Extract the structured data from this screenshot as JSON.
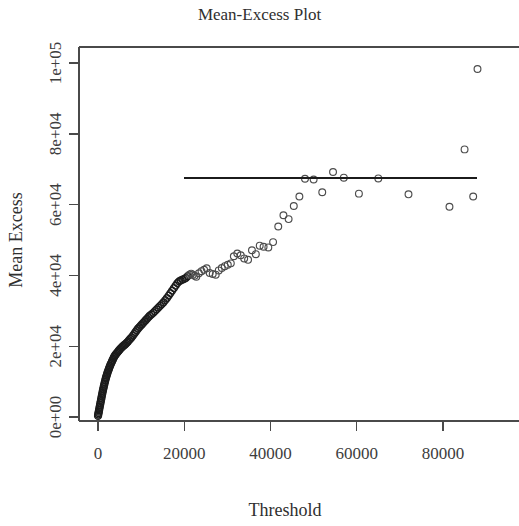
{
  "chart_data": {
    "type": "scatter",
    "title": "Mean-Excess Plot",
    "xlabel": "Threshold",
    "ylabel": "Mean Excess",
    "xlim": [
      -4000,
      98000
    ],
    "ylim": [
      -4000,
      104000
    ],
    "xticks": [
      0,
      20000,
      40000,
      60000,
      80000
    ],
    "xticklabels": [
      "0",
      "20000",
      "40000",
      "60000",
      "80000"
    ],
    "yticks": [
      0,
      20000,
      40000,
      60000,
      80000,
      100000
    ],
    "yticklabels": [
      "0e+00",
      "2e+04",
      "4e+04",
      "6e+04",
      "8e+04",
      "1e+05"
    ],
    "grid": false,
    "legend": null,
    "marker": "open-circle",
    "marker_color": "#4c4c4c",
    "reference_line": {
      "type": "horizontal",
      "y": 67500,
      "x_start": 19900,
      "x_end": 87900,
      "color": "#1b1b1b"
    },
    "points": [
      [
        10,
        300
      ],
      [
        60,
        700
      ],
      [
        120,
        1100
      ],
      [
        180,
        1500
      ],
      [
        250,
        1900
      ],
      [
        320,
        2400
      ],
      [
        400,
        2900
      ],
      [
        480,
        3400
      ],
      [
        560,
        3900
      ],
      [
        640,
        4400
      ],
      [
        720,
        4900
      ],
      [
        800,
        5400
      ],
      [
        880,
        5900
      ],
      [
        960,
        6400
      ],
      [
        1040,
        6900
      ],
      [
        1130,
        7400
      ],
      [
        1220,
        7900
      ],
      [
        1310,
        8400
      ],
      [
        1400,
        8900
      ],
      [
        1500,
        9400
      ],
      [
        1600,
        9900
      ],
      [
        1700,
        10400
      ],
      [
        1800,
        10900
      ],
      [
        1900,
        11300
      ],
      [
        2000,
        11700
      ],
      [
        2100,
        12100
      ],
      [
        2200,
        12500
      ],
      [
        2320,
        12900
      ],
      [
        2440,
        13300
      ],
      [
        2560,
        13700
      ],
      [
        2680,
        14100
      ],
      [
        2800,
        14500
      ],
      [
        2950,
        14900
      ],
      [
        3100,
        15300
      ],
      [
        3250,
        15700
      ],
      [
        3400,
        16100
      ],
      [
        3550,
        16500
      ],
      [
        3700,
        16900
      ],
      [
        3850,
        17200
      ],
      [
        4000,
        17500
      ],
      [
        4200,
        17800
      ],
      [
        4400,
        18100
      ],
      [
        4600,
        18400
      ],
      [
        4800,
        18700
      ],
      [
        5000,
        19000
      ],
      [
        5200,
        19300
      ],
      [
        5450,
        19600
      ],
      [
        5700,
        19900
      ],
      [
        5950,
        20200
      ],
      [
        6200,
        20400
      ],
      [
        6450,
        20700
      ],
      [
        6700,
        21000
      ],
      [
        6950,
        21300
      ],
      [
        7200,
        21700
      ],
      [
        7500,
        22100
      ],
      [
        7800,
        22500
      ],
      [
        8100,
        23000
      ],
      [
        8400,
        23500
      ],
      [
        8700,
        24000
      ],
      [
        9000,
        24500
      ],
      [
        9300,
        25000
      ],
      [
        9600,
        25400
      ],
      [
        9900,
        25800
      ],
      [
        10200,
        26200
      ],
      [
        10500,
        26600
      ],
      [
        10800,
        27000
      ],
      [
        11100,
        27400
      ],
      [
        11400,
        27800
      ],
      [
        11700,
        28200
      ],
      [
        12000,
        28600
      ],
      [
        12400,
        29000
      ],
      [
        12800,
        29400
      ],
      [
        13200,
        29900
      ],
      [
        13600,
        30400
      ],
      [
        14000,
        30900
      ],
      [
        14400,
        31400
      ],
      [
        14800,
        31900
      ],
      [
        15200,
        32400
      ],
      [
        15600,
        33000
      ],
      [
        16000,
        33600
      ],
      [
        16400,
        34300
      ],
      [
        16800,
        35000
      ],
      [
        17200,
        35700
      ],
      [
        17600,
        36400
      ],
      [
        18000,
        37100
      ],
      [
        18400,
        37800
      ],
      [
        18800,
        38300
      ],
      [
        19200,
        38600
      ],
      [
        19600,
        38800
      ],
      [
        20000,
        39000
      ],
      [
        20400,
        39300
      ],
      [
        20800,
        39800
      ],
      [
        21200,
        40200
      ],
      [
        21600,
        40500
      ],
      [
        22000,
        40200
      ],
      [
        22400,
        39900
      ],
      [
        22800,
        39600
      ],
      [
        23400,
        40600
      ],
      [
        24000,
        41200
      ],
      [
        24600,
        41600
      ],
      [
        25200,
        42000
      ],
      [
        25900,
        40700
      ],
      [
        26600,
        40400
      ],
      [
        27300,
        40200
      ],
      [
        28000,
        41400
      ],
      [
        28700,
        42100
      ],
      [
        29400,
        42600
      ],
      [
        30100,
        43000
      ],
      [
        30800,
        43400
      ],
      [
        31500,
        45400
      ],
      [
        32300,
        46200
      ],
      [
        33100,
        45700
      ],
      [
        33900,
        44800
      ],
      [
        34800,
        44400
      ],
      [
        35700,
        47100
      ],
      [
        36600,
        46000
      ],
      [
        37500,
        48400
      ],
      [
        38400,
        48100
      ],
      [
        39500,
        47900
      ],
      [
        40600,
        49400
      ],
      [
        41800,
        53800
      ],
      [
        43000,
        57000
      ],
      [
        44200,
        55900
      ],
      [
        45400,
        59600
      ],
      [
        46700,
        62300
      ],
      [
        48000,
        67300
      ],
      [
        50000,
        67100
      ],
      [
        52000,
        63500
      ],
      [
        54500,
        69200
      ],
      [
        57000,
        67600
      ],
      [
        60500,
        63100
      ],
      [
        65000,
        67400
      ],
      [
        72000,
        62900
      ],
      [
        81500,
        59400
      ],
      [
        85000,
        75600
      ],
      [
        87000,
        62300
      ],
      [
        88000,
        98300
      ]
    ],
    "points_dense_count": 137,
    "note": "Dense cluster of overlapping open circles at low thresholds"
  },
  "figure": {
    "background": "#ffffff",
    "foreground": "#3a3a3a",
    "width": 519,
    "height": 526
  }
}
